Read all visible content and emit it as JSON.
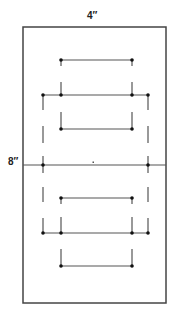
{
  "labels": {
    "width": "4″",
    "height": "8″"
  },
  "colors": {
    "line": "#555555",
    "border": "#444444",
    "dot": "#111111",
    "background": "#ffffff"
  },
  "panel": {
    "x": 23,
    "y": 27,
    "width": 143,
    "height": 276
  },
  "center_line_y": 165,
  "center_mark": {
    "x": 93,
    "y": 162
  },
  "bars": [
    {
      "name": "upper-short-bar",
      "y": 60,
      "x1": 61,
      "x2": 132
    },
    {
      "name": "upper-wide-bar",
      "y": 95,
      "x1": 43,
      "x2": 148
    },
    {
      "name": "upper-inner-bracket",
      "y": 129,
      "x1": 61,
      "x2": 132
    },
    {
      "name": "lower-short-bar",
      "y": 198,
      "x1": 61,
      "x2": 132
    },
    {
      "name": "lower-wide-bar",
      "y": 233,
      "x1": 43,
      "x2": 148
    },
    {
      "name": "lower-inner-bracket",
      "y": 266,
      "x1": 61,
      "x2": 132
    }
  ]
}
